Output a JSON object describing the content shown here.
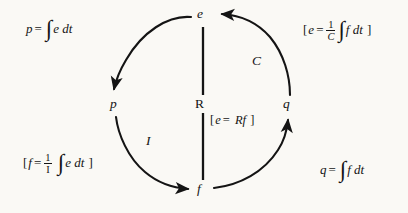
{
  "diagram": {
    "background_color": "#faf9f5",
    "ink_color": "#141414",
    "nodes": [
      {
        "id": "e",
        "label": "e",
        "meaning": "effort",
        "x": 203,
        "y": 14
      },
      {
        "id": "p",
        "label": "p",
        "meaning": "momentum",
        "x": 115,
        "y": 104
      },
      {
        "id": "q",
        "label": "q",
        "meaning": "charge",
        "x": 288,
        "y": 104
      },
      {
        "id": "f",
        "label": "f",
        "meaning": "flow",
        "x": 203,
        "y": 189
      },
      {
        "id": "R",
        "label": "R",
        "meaning": "resistance",
        "x": 201,
        "y": 104
      }
    ],
    "arc_labels": [
      {
        "id": "C",
        "label": "C",
        "meaning": "capacitance",
        "x": 257,
        "y": 61
      },
      {
        "id": "I",
        "label": "I",
        "meaning": "inertance",
        "x": 150,
        "y": 141
      }
    ],
    "arrows": [
      {
        "from": "e",
        "to": "p",
        "side": "left-top",
        "direction": "down-left"
      },
      {
        "from": "p",
        "to": "f",
        "side": "left-bottom",
        "direction": "down-right",
        "label": "I"
      },
      {
        "from": "f",
        "to": "q",
        "side": "right-bottom",
        "direction": "up-right"
      },
      {
        "from": "q",
        "to": "e",
        "side": "right-top",
        "direction": "up-left",
        "label": "C"
      },
      {
        "from": "e",
        "to": "f",
        "side": "center",
        "direction": "vertical",
        "label": "R"
      }
    ],
    "equations": [
      {
        "id": "eq-p",
        "position": "top-left",
        "bracketed": false,
        "text": "p = ∫ e dt",
        "lhs": "p",
        "rel": "=",
        "integrand": "e",
        "differential": "dt"
      },
      {
        "id": "eq-e-cap",
        "position": "top-right",
        "bracketed": true,
        "text": "[ e = (1/C) ∫ f dt ]",
        "lhs": "e",
        "rel": "=",
        "coefficient_numerator": "1",
        "coefficient_denominator": "C",
        "integrand": "f",
        "differential": "dt",
        "open_bracket": "[",
        "close_bracket": "]"
      },
      {
        "id": "eq-f-ind",
        "position": "bottom-left",
        "bracketed": true,
        "text": "[ f = (1/I) ∫ e dt ]",
        "lhs": "f",
        "rel": "=",
        "coefficient_numerator": "1",
        "coefficient_denominator": "I",
        "integrand": "e",
        "differential": "dt",
        "open_bracket": "[",
        "close_bracket": "]"
      },
      {
        "id": "eq-q",
        "position": "bottom-right",
        "bracketed": false,
        "text": "q = ∫ f dt",
        "lhs": "q",
        "rel": "=",
        "integrand": "f",
        "differential": "dt"
      },
      {
        "id": "eq-e-res",
        "position": "center",
        "bracketed": true,
        "text": "[ e = R f ]",
        "lhs": "e",
        "rel": "=",
        "rhs_coefficient": "R",
        "rhs_variable": "f",
        "open_bracket": "[",
        "close_bracket": "]"
      }
    ],
    "glyphs": {
      "integral": "∫",
      "equals": "=",
      "dt": "dt",
      "one": "1",
      "open_bracket": "[",
      "close_bracket": "]"
    }
  }
}
